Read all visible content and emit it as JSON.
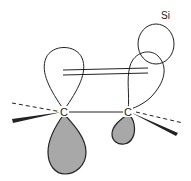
{
  "diagram": {
    "title": "",
    "labels": {
      "atom_left": "C",
      "atom_right": "C",
      "substituent": "Si"
    },
    "colors": {
      "line": "#222222",
      "shaded_lobe": "#a8a8a8",
      "background": "#ffffff"
    },
    "elements": [
      {
        "id": "carbon-left",
        "type": "atom",
        "label": "C"
      },
      {
        "id": "carbon-right",
        "type": "atom",
        "label": "C"
      },
      {
        "id": "silicon-orbital",
        "type": "orbital",
        "label": "Si"
      },
      {
        "id": "p-orbital-left-upper",
        "type": "lobe",
        "shaded": false
      },
      {
        "id": "p-orbital-left-lower",
        "type": "lobe",
        "shaded": true
      },
      {
        "id": "p-orbital-right-upper",
        "type": "lobe",
        "shaded": false
      },
      {
        "id": "p-orbital-right-lower",
        "type": "lobe",
        "shaded": true
      },
      {
        "id": "pi-overlap",
        "type": "double-line"
      },
      {
        "id": "sigma-bond",
        "type": "line"
      }
    ]
  }
}
